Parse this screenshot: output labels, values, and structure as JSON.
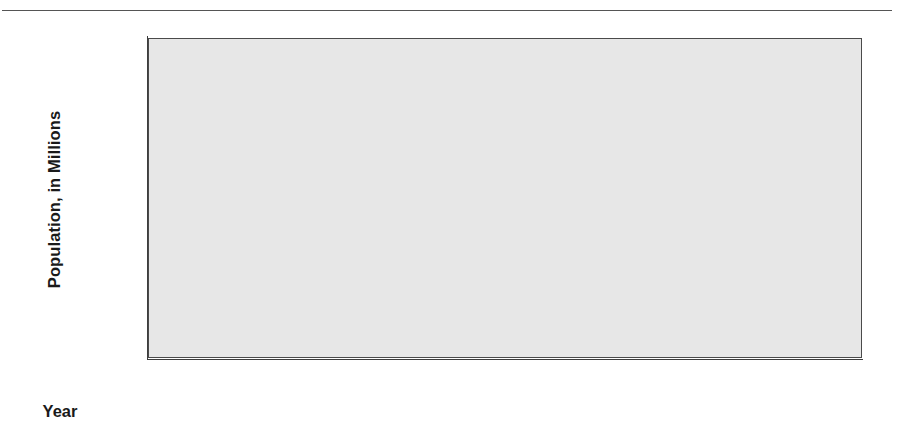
{
  "chart_data": {
    "type": "bar",
    "title": "",
    "subtitle": "",
    "categories": [
      "1990",
      "2000",
      "2010",
      "2020",
      "2030",
      "2040",
      "2050"
    ],
    "values": [
      40.1,
      41.6,
      42.9,
      43.7,
      43.9,
      45.65,
      46.1
    ],
    "xlabel": "Year",
    "ylabel": "Population, in Millions",
    "ylim": [
      37.0,
      47.0
    ],
    "ytick_labels": [
      "47.0",
      "46.0",
      "45.0",
      "44.0",
      "43.0",
      "42.0",
      "41.0",
      "40.0",
      "39.0",
      "38.0",
      "37.0"
    ],
    "ytick_values": [
      47.0,
      46.0,
      45.0,
      44.0,
      43.0,
      42.0,
      41.0,
      40.0,
      39.0,
      38.0,
      37.0
    ],
    "ystep": 1.0,
    "grid": false,
    "legend": null,
    "legend_position": "none",
    "annotations": [],
    "colors": {
      "bar_fill": "#3b3b3b",
      "bar_edge": "#2c2c2c",
      "plot_background": "#e7e7e7",
      "axis": "#3d3d3d",
      "text": "#1a1a1a",
      "page_background": "#ffffff",
      "rule": "#555555"
    }
  },
  "figure": {
    "top_rule": "",
    "x_axis_title": "Year",
    "y_axis_title": "Population, in Millions"
  }
}
